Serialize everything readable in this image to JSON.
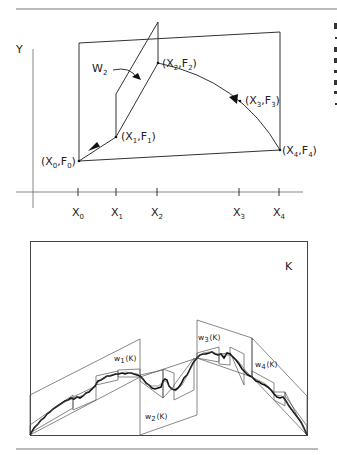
{
  "figure": {
    "top_panel": {
      "axis_y_label": "Y",
      "map_label": "W",
      "map_label_sub": "2",
      "points": [
        {
          "id": "p0",
          "x_label": "X",
          "x_sub": "0",
          "f_label": "F",
          "f_sub": "0",
          "text": "(X0,F0)"
        },
        {
          "id": "p1",
          "x_label": "X",
          "x_sub": "1",
          "f_label": "F",
          "f_sub": "1",
          "text": "(X1,F1)"
        },
        {
          "id": "p2",
          "x_label": "X",
          "x_sub": "2",
          "f_label": "F",
          "f_sub": "2",
          "text": "(X2,F2)"
        },
        {
          "id": "p3",
          "x_label": "X",
          "x_sub": "3",
          "f_label": "F",
          "f_sub": "3",
          "text": "(X3,F3)"
        },
        {
          "id": "p4",
          "x_label": "X",
          "x_sub": "4",
          "f_label": "F",
          "f_sub": "4",
          "text": "(X4,F4)"
        }
      ],
      "x_ticks": [
        {
          "base": "X",
          "sub": "0"
        },
        {
          "base": "X",
          "sub": "1"
        },
        {
          "base": "X",
          "sub": "2"
        },
        {
          "base": "X",
          "sub": "3"
        },
        {
          "base": "X",
          "sub": "4"
        }
      ]
    },
    "bottom_panel": {
      "set_label": "K",
      "maps": [
        {
          "base": "w",
          "sub": "1",
          "arg": "(K)"
        },
        {
          "base": "w",
          "sub": "2",
          "arg": "(K)"
        },
        {
          "base": "w",
          "sub": "3",
          "arg": "(K)"
        },
        {
          "base": "w",
          "sub": "4",
          "arg": "(K)"
        }
      ]
    }
  }
}
